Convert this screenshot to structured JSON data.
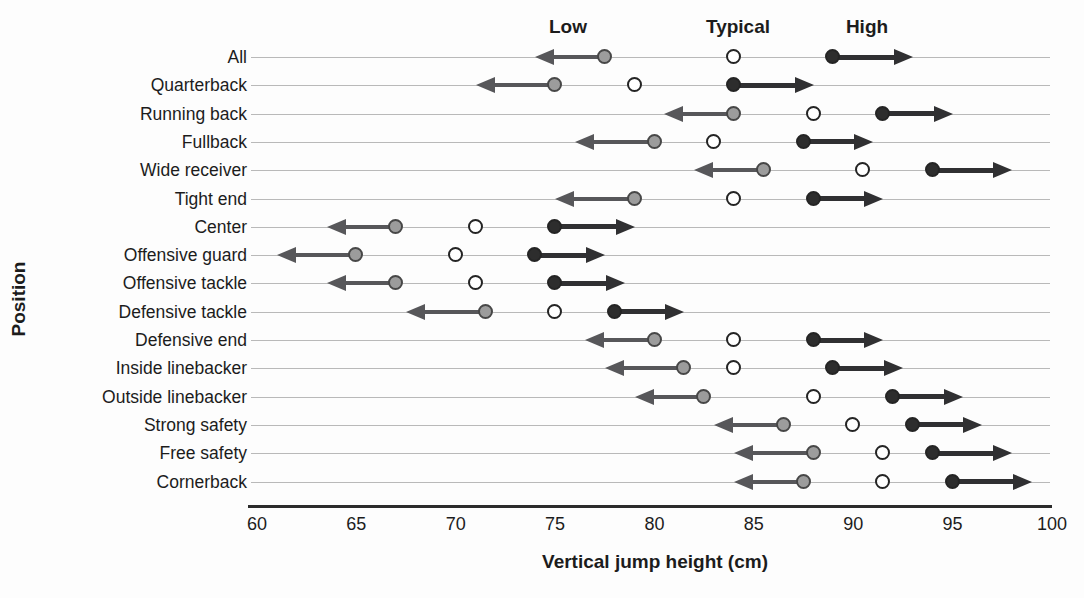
{
  "chart_data": {
    "type": "scatter",
    "title": "",
    "xlabel": "Vertical jump height (cm)",
    "ylabel": "Position",
    "xlim": [
      60,
      100
    ],
    "xticks": [
      60,
      65,
      70,
      75,
      80,
      85,
      90,
      95,
      100
    ],
    "grid": "horizontal-row-guide-lines",
    "legend_position": "inline-labels-above-first-row",
    "legend_labels": [
      {
        "label": "Low",
        "marker": "filled-gray-circle",
        "x": 75.6
      },
      {
        "label": "Typical",
        "marker": "open-circle",
        "x": 84.2
      },
      {
        "label": "High",
        "marker": "filled-black-circle",
        "x": 90.7
      }
    ],
    "categories": [
      "All",
      "Quarterback",
      "Running back",
      "Fullback",
      "Wide receiver",
      "Tight end",
      "Center",
      "Offensive guard",
      "Offensive tackle",
      "Defensive tackle",
      "Defensive end",
      "Inside linebacker",
      "Outside linebacker",
      "Strong safety",
      "Free safety",
      "Cornerback"
    ],
    "series": [
      {
        "name": "Low",
        "marker": "filled-gray-circle",
        "values": [
          77.5,
          75,
          84,
          80,
          85.5,
          79,
          67,
          65,
          67,
          71.5,
          80,
          81.5,
          82.5,
          86.5,
          88,
          87.5
        ]
      },
      {
        "name": "Typical",
        "marker": "open-circle",
        "values": [
          84,
          79,
          88,
          83,
          90.5,
          84,
          71,
          70,
          71,
          75,
          84,
          84,
          88,
          90,
          91.5,
          91.5
        ]
      },
      {
        "name": "High",
        "marker": "filled-black-circle",
        "values": [
          89,
          84,
          91.5,
          87.5,
          94,
          88,
          75,
          74,
          75,
          78,
          88,
          89,
          92,
          93,
          94,
          95
        ]
      },
      {
        "name": "Range arrow min",
        "marker": "left-arrow-tip",
        "values": [
          74,
          71,
          80.5,
          76,
          82,
          75,
          63.5,
          61,
          63.5,
          67.5,
          76.5,
          77.5,
          79,
          83,
          84,
          84
        ]
      },
      {
        "name": "Range arrow max",
        "marker": "right-arrow-tip",
        "values": [
          93,
          88,
          95,
          91,
          98,
          91.5,
          79,
          77.5,
          78.5,
          81.5,
          91.5,
          92.5,
          95.5,
          96.5,
          98,
          99
        ]
      }
    ]
  },
  "colors": {
    "low_dot_fill": "#9c9c9c",
    "typical_dot_fill": "#ffffff",
    "high_dot_fill": "#2d2d2d",
    "dot_stroke": "#2e2e2e",
    "left_arrow": "#57575a",
    "right_arrow": "#303032",
    "row_guide_line": "#b9b9b9",
    "axis_line": "#2b2b2b",
    "text": "#1c1c1c",
    "background": "#fdfdfd"
  }
}
